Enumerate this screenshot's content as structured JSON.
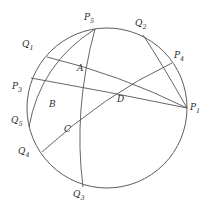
{
  "figure": {
    "kind": "hyperbolic-geodesic-diagram",
    "background_color": "#ffffff",
    "stroke_color": "#555555",
    "boundary_stroke_color": "#4a4a4a",
    "label_color": "#2b2b2b",
    "boundary_circle": {
      "cx": 107,
      "cy": 108,
      "r": 80
    },
    "boundary_points": [
      {
        "name": "P1",
        "base": "P",
        "sub": "1",
        "x": 187,
        "y": 108,
        "label_x": 190,
        "label_y": 103
      },
      {
        "name": "P3",
        "base": "P",
        "sub": "3",
        "x": 31,
        "y": 78,
        "label_x": 12,
        "label_y": 82
      },
      {
        "name": "P4",
        "base": "P",
        "sub": "4",
        "x": 172,
        "y": 63,
        "label_x": 174,
        "label_y": 51
      },
      {
        "name": "P5",
        "base": "P",
        "sub": "5",
        "x": 95,
        "y": 29,
        "label_x": 84,
        "label_y": 13
      },
      {
        "name": "Q1",
        "base": "Q",
        "sub": "1",
        "x": 47,
        "y": 57,
        "label_x": 22,
        "label_y": 40
      },
      {
        "name": "Q2",
        "base": "Q",
        "sub": "2",
        "x": 143,
        "y": 35,
        "label_x": 135,
        "label_y": 19
      },
      {
        "name": "Q3",
        "base": "Q",
        "sub": "3",
        "x": 83,
        "y": 187,
        "label_x": 73,
        "label_y": 190
      },
      {
        "name": "Q4",
        "base": "Q",
        "sub": "4",
        "x": 42,
        "y": 152,
        "label_x": 18,
        "label_y": 147
      },
      {
        "name": "Q5",
        "base": "Q",
        "sub": "5",
        "x": 29,
        "y": 127,
        "label_x": 11,
        "label_y": 116
      }
    ],
    "interior_points": [
      {
        "name": "A",
        "x": 83,
        "y": 74,
        "label_x": 77,
        "label_y": 64
      },
      {
        "name": "B",
        "x": 57,
        "y": 110,
        "label_x": 49,
        "label_y": 100
      },
      {
        "name": "C",
        "x": 70,
        "y": 135,
        "label_x": 64,
        "label_y": 125
      },
      {
        "name": "D",
        "x": 123,
        "y": 105,
        "label_x": 117,
        "label_y": 95
      }
    ],
    "geodesics": [
      {
        "name": "arc-P1-P3",
        "from": "P3",
        "to": "P1",
        "path": "M 31 78 Q 110 92 187 108"
      },
      {
        "name": "arc-P4-Q4",
        "from": "P4",
        "to": "Q4",
        "path": "M 172 63 Q 104 95 42 152"
      },
      {
        "name": "arc-P5-Q3",
        "from": "P5",
        "to": "Q3",
        "path": "M 95 29 Q 73 110 83 187"
      },
      {
        "name": "arc-P5-Q5",
        "from": "P5",
        "to": "Q5",
        "path": "M 95 29 Q 40 64 29 127"
      },
      {
        "name": "arc-Q1-P1",
        "from": "Q1",
        "to": "P1",
        "path": "M 47 57 Q 118 74 187 108"
      },
      {
        "name": "arc-Q2-P1",
        "from": "Q2",
        "to": "P1",
        "path": "M 143 35 Q 161 62 187 108"
      }
    ]
  }
}
